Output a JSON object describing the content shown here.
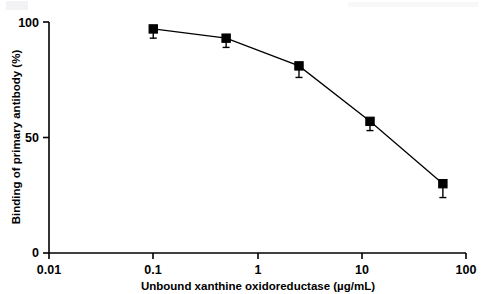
{
  "chart_data": {
    "type": "line",
    "title": "",
    "xlabel": "Unbound xanthine oxidoreductase (µg/mL)",
    "ylabel": "Binding of primary antibody (%)",
    "xscale": "log",
    "yscale": "linear",
    "xlim": [
      0.01,
      100
    ],
    "ylim": [
      0,
      100
    ],
    "xticks": [
      0.01,
      0.1,
      1,
      10,
      100
    ],
    "xtick_labels": [
      "0.01",
      "0.1",
      "1",
      "10",
      "100"
    ],
    "yticks": [
      0,
      50,
      100
    ],
    "ytick_labels": [
      "0",
      "50",
      "100"
    ],
    "grid": false,
    "legend": null,
    "marker": "filled-square",
    "marker_color": "#000000",
    "line_color": "#000000",
    "series": [
      {
        "name": "Binding of primary antibody",
        "x": [
          0.1,
          0.5,
          2.5,
          12,
          60
        ],
        "values": [
          97,
          93,
          81,
          57,
          30
        ],
        "yerr_low": [
          4,
          4,
          5,
          4,
          6
        ],
        "yerr_high": [
          0,
          0,
          0,
          0,
          0
        ]
      }
    ]
  },
  "axes": {
    "x_title": "Unbound xanthine oxidoreductase (µg/mL)",
    "y_title": "Binding of primary antibody (%)",
    "x_tick_labels": [
      "0.01",
      "0.1",
      "1",
      "10",
      "100"
    ],
    "y_tick_labels": [
      "0",
      "50",
      "100"
    ]
  }
}
